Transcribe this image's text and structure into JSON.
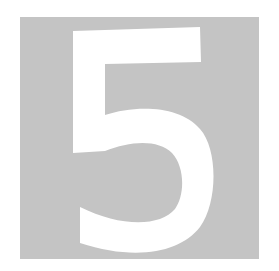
{
  "tile": {
    "digit": "5",
    "colors": {
      "background": "#ffffff",
      "tile": "#c4c4c4",
      "digit": "#ffffff"
    }
  }
}
